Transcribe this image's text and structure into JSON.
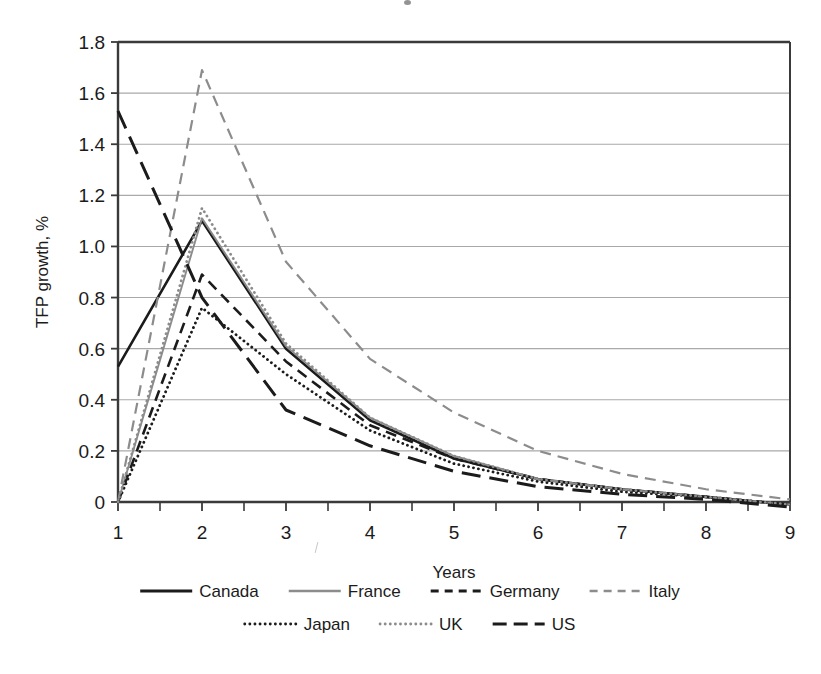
{
  "figure": {
    "background": "#ffffff",
    "ink": "#1b1b1b",
    "grid_color": "#a9a9a9",
    "axis_color": "#3a3a3a",
    "gray_series_color": "#8c8c8c"
  },
  "axes": {
    "y_title": "TFP growth, %",
    "x_title": "Years",
    "y_ticks": [
      "1.8",
      "1.6",
      "1.4",
      "1.2",
      "1.0",
      "0.8",
      "0.6",
      "0.4",
      "0.2",
      "0"
    ],
    "x_ticks": [
      "1",
      "2",
      "3",
      "4",
      "5",
      "6",
      "7",
      "8",
      "9"
    ]
  },
  "legend": {
    "rows": [
      [
        {
          "label": "Canada",
          "style": "solid-black"
        },
        {
          "label": "France",
          "style": "solid-gray"
        },
        {
          "label": "Germany",
          "style": "dash-black"
        },
        {
          "label": "Italy",
          "style": "dash-gray"
        }
      ],
      [
        {
          "label": "Japan",
          "style": "dot-black"
        },
        {
          "label": "UK",
          "style": "dot-gray"
        },
        {
          "label": "US",
          "style": "longdash-black"
        }
      ]
    ]
  },
  "chart_data": {
    "type": "line",
    "title": "",
    "xlabel": "Years",
    "ylabel": "TFP growth, %",
    "x": [
      1,
      2,
      3,
      4,
      5,
      6,
      7,
      8,
      9
    ],
    "xlim": [
      1,
      9
    ],
    "ylim": [
      0,
      1.8
    ],
    "y_tick_values": [
      0,
      0.2,
      0.4,
      0.6,
      0.8,
      1.0,
      1.2,
      1.4,
      1.6,
      1.8
    ],
    "grid": "horizontal",
    "legend_position": "bottom",
    "series": [
      {
        "name": "Canada",
        "style": "solid",
        "color": "#1b1b1b",
        "width": 2.6,
        "values": [
          0.53,
          1.1,
          0.6,
          0.32,
          0.17,
          0.09,
          0.05,
          0.02,
          -0.01
        ]
      },
      {
        "name": "France",
        "style": "solid",
        "color": "#8c8c8c",
        "width": 1.9,
        "values": [
          0.0,
          1.11,
          0.61,
          0.33,
          0.18,
          0.09,
          0.05,
          0.02,
          -0.01
        ]
      },
      {
        "name": "Germany",
        "style": "dashed",
        "color": "#1b1b1b",
        "width": 2.6,
        "values": [
          0.0,
          0.89,
          0.55,
          0.3,
          0.17,
          0.09,
          0.05,
          0.02,
          -0.01
        ]
      },
      {
        "name": "Italy",
        "style": "dashed",
        "color": "#8c8c8c",
        "width": 2.2,
        "values": [
          0.0,
          1.69,
          0.94,
          0.56,
          0.35,
          0.2,
          0.11,
          0.05,
          0.01
        ]
      },
      {
        "name": "Japan",
        "style": "dotted",
        "color": "#1b1b1b",
        "width": 2.8,
        "values": [
          0.0,
          0.76,
          0.5,
          0.28,
          0.15,
          0.08,
          0.04,
          0.02,
          -0.01
        ]
      },
      {
        "name": "UK",
        "style": "dotted",
        "color": "#8c8c8c",
        "width": 2.8,
        "values": [
          0.0,
          1.15,
          0.62,
          0.33,
          0.18,
          0.09,
          0.05,
          0.02,
          -0.01
        ]
      },
      {
        "name": "US",
        "style": "long-dashed",
        "color": "#1b1b1b",
        "width": 3.0,
        "values": [
          1.53,
          0.8,
          0.36,
          0.22,
          0.12,
          0.06,
          0.03,
          0.01,
          -0.02
        ]
      }
    ]
  }
}
